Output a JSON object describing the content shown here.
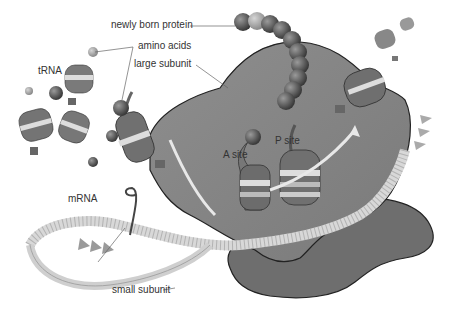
{
  "diagram": {
    "labels": {
      "newly_born_protein": "newly born protein",
      "amino_acids": "amino acids",
      "large_subunit": "large subunit",
      "trna": "tRNA",
      "a_site": "A site",
      "p_site": "P site",
      "mrna": "mRNA",
      "small_subunit": "small subunit"
    },
    "colors": {
      "large_subunit": "#8a8a8a",
      "small_subunit": "#6e6e6e",
      "outline": "#222222",
      "mrna": "#d8d8d8",
      "amino_acid": "#4a4a4a",
      "amino_acid_light": "#9a9a9a",
      "leader_line": "#666666",
      "text": "#333333"
    }
  }
}
